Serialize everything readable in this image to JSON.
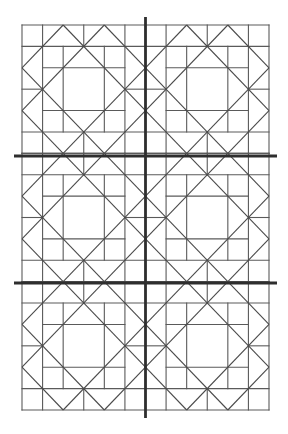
{
  "diagram": {
    "title": "",
    "type": "quilt-block-pattern",
    "layout": {
      "block_columns": 2,
      "block_rows": 3,
      "cells_per_block": 6
    },
    "bounds": {
      "left": 22,
      "top": 25,
      "right": 269,
      "bottom": 410
    },
    "dividers": {
      "vertical": [
        {
          "x": 145.5,
          "y1": 17,
          "y2": 418
        }
      ],
      "horizontal": [
        {
          "y": 156,
          "x1": 14,
          "x2": 277
        },
        {
          "y": 283,
          "x1": 14,
          "x2": 277
        }
      ]
    },
    "block": {
      "segments_in_cell_units": [
        [
          0,
          0,
          6,
          0
        ],
        [
          0,
          6,
          6,
          6
        ],
        [
          0,
          0,
          0,
          6
        ],
        [
          6,
          0,
          6,
          6
        ],
        [
          0,
          1,
          6,
          1
        ],
        [
          0,
          5,
          6,
          5
        ],
        [
          1,
          2,
          5,
          2
        ],
        [
          1,
          4,
          5,
          4
        ],
        [
          0,
          3,
          1,
          3
        ],
        [
          5,
          3,
          6,
          3
        ],
        [
          1,
          0,
          1,
          6
        ],
        [
          5,
          0,
          5,
          6
        ],
        [
          2,
          1,
          2,
          5
        ],
        [
          4,
          1,
          4,
          5
        ],
        [
          3,
          0,
          3,
          1
        ],
        [
          3,
          5,
          3,
          6
        ],
        [
          0,
          2,
          2,
          0
        ],
        [
          4,
          0,
          6,
          2
        ],
        [
          6,
          4,
          4,
          6
        ],
        [
          2,
          6,
          0,
          4
        ],
        [
          2,
          0,
          6,
          4
        ],
        [
          4,
          0,
          0,
          4
        ],
        [
          0,
          2,
          4,
          6
        ],
        [
          6,
          2,
          2,
          6
        ]
      ]
    },
    "colors": {
      "background": "#ffffff",
      "thin_line": "#5a5a5a",
      "divider_line": "#2e2e2e"
    }
  }
}
